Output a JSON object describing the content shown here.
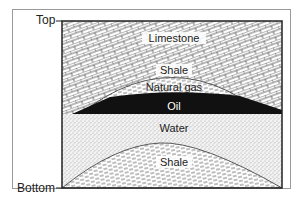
{
  "diagram": {
    "title": "",
    "type": "geological-cross-section",
    "axis": {
      "top_label": "Top",
      "bottom_label": "Bottom"
    },
    "layers": [
      {
        "name": "Limestone",
        "label": "Limestone",
        "pattern": "brick"
      },
      {
        "name": "Shale",
        "label": "Shale",
        "pattern": "dashes"
      },
      {
        "name": "Natural gas",
        "label": "Natural gas",
        "pattern": "fine-stipple"
      },
      {
        "name": "Oil",
        "label": "Oil",
        "pattern": "solid-black"
      },
      {
        "name": "Water",
        "label": "Water",
        "pattern": "stipple"
      },
      {
        "name": "Shale",
        "label": "Shale",
        "pattern": "dashes"
      }
    ],
    "colors": {
      "oil": "#111111",
      "outline": "#222222",
      "frame": "#9a9a9a",
      "oil_label": "#ffffff",
      "label": "#222222"
    }
  }
}
